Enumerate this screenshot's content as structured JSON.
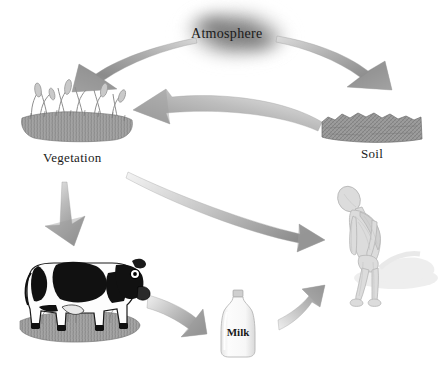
{
  "diagram": {
    "background_color": "#ffffff",
    "arrow_color": "#8d8d8d",
    "text_color": "#1a1a1a"
  },
  "nodes": [
    {
      "id": "atmosphere",
      "label": "Atmosphere",
      "icon": "cloud-icon",
      "x": 191,
      "y": 26,
      "color": "#9a9a9a"
    },
    {
      "id": "vegetation",
      "label": "Vegetation",
      "icon": "grass-icon",
      "x": 43,
      "y": 150,
      "color": "#8a8a8a"
    },
    {
      "id": "soil",
      "label": "Soil",
      "icon": "soil-block-icon",
      "x": 361,
      "y": 146,
      "color": "#8a8a8a"
    },
    {
      "id": "cow",
      "label": "",
      "icon": "cow-icon",
      "x": 20,
      "y": 245,
      "color": "#111111"
    },
    {
      "id": "milk",
      "label": "Milk",
      "icon": "milk-bottle-icon",
      "x": 224,
      "y": 314,
      "color": "#f2f2f2"
    },
    {
      "id": "human",
      "label": "",
      "icon": "human-figure-icon",
      "x": 330,
      "y": 185,
      "color": "#d6d6d6"
    }
  ],
  "arrows": [
    {
      "id": "atmosphere-to-vegetation",
      "from": "atmosphere",
      "to": "vegetation",
      "shape": "curved-down-left"
    },
    {
      "id": "atmosphere-to-soil",
      "from": "atmosphere",
      "to": "soil",
      "shape": "curved-down-right"
    },
    {
      "id": "soil-to-vegetation",
      "from": "soil",
      "to": "vegetation",
      "shape": "curved-left"
    },
    {
      "id": "vegetation-to-cow",
      "from": "vegetation",
      "to": "cow",
      "shape": "straight-down"
    },
    {
      "id": "vegetation-to-human",
      "from": "vegetation",
      "to": "human",
      "shape": "long-curved-down-right"
    },
    {
      "id": "cow-to-milk",
      "from": "cow",
      "to": "milk",
      "shape": "curved-down-right"
    },
    {
      "id": "milk-to-human",
      "from": "milk",
      "to": "human",
      "shape": "curved-up-right"
    }
  ]
}
